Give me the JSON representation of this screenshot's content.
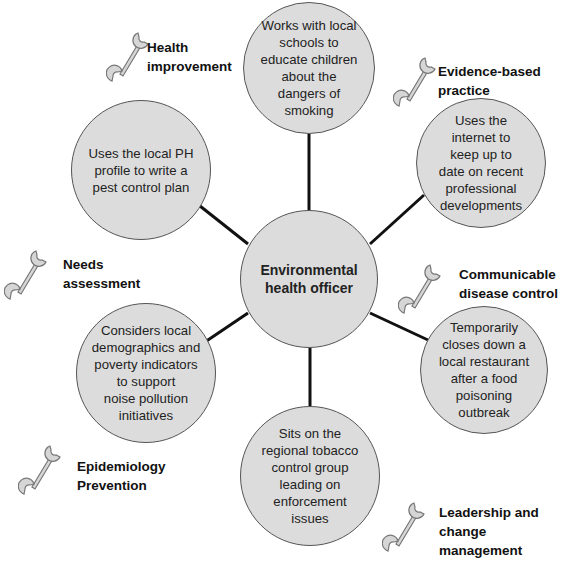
{
  "center": {
    "label": "Environmental\nhealth officer"
  },
  "nodes": [
    {
      "id": "top",
      "text": "Works with local\nschools to\neducate children\nabout the\ndangers of\nsmoking"
    },
    {
      "id": "upper-left",
      "text": "Uses the local PH\nprofile to write a\npest control plan"
    },
    {
      "id": "upper-right",
      "text": "Uses the\ninternet to\nkeep up to\ndate on recent\nprofessional\ndevelopments"
    },
    {
      "id": "lower-left",
      "text": "Considers local\ndemographics and\npoverty indicators\nto support\nnoise pollution\ninitiatives"
    },
    {
      "id": "lower-right",
      "text": "Temporarily\ncloses down a\nlocal restaurant\nafter a food\npoisoning\noutbreak"
    },
    {
      "id": "bottom",
      "text": "Sits on the\nregional tobacco\ncontrol group\nleading on\nenforcement\nissues"
    }
  ],
  "competencies": [
    {
      "label": "Health\nimprovement",
      "icon": "wrench-icon"
    },
    {
      "label": "Evidence-based\npractice",
      "icon": "wrench-icon"
    },
    {
      "label": "Needs\nassessment",
      "icon": "wrench-icon"
    },
    {
      "label": "Communicable\ndisease control",
      "icon": "wrench-icon"
    },
    {
      "label": "Epidemiology\nPrevention",
      "icon": "wrench-icon"
    },
    {
      "label": "Leadership and\nchange\nmanagement",
      "icon": "wrench-icon"
    }
  ],
  "colors": {
    "node_fill": "#dcdcdc",
    "node_stroke": "#555555",
    "connector": "#111111",
    "wrench": "#d4d4d4"
  }
}
